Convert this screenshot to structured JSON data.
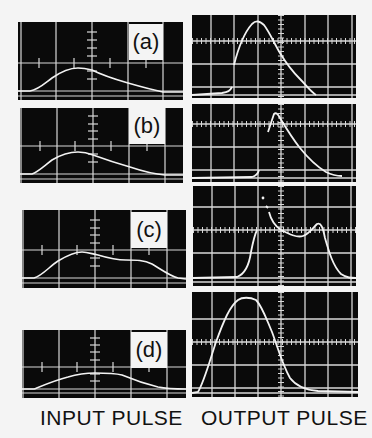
{
  "figure": {
    "captions": {
      "input": "INPUT PULSE",
      "output": "OUTPUT PULSE"
    },
    "panels": [
      {
        "id": "a",
        "label": "(a)"
      },
      {
        "id": "b",
        "label": "(b)"
      },
      {
        "id": "c",
        "label": "(c)"
      },
      {
        "id": "d",
        "label": "(d)"
      }
    ],
    "colors": {
      "screen": "#0a0a0a",
      "trace": "#f2f2f2",
      "grid": "#d8d8d8",
      "paper": "#f4f4f4"
    }
  }
}
